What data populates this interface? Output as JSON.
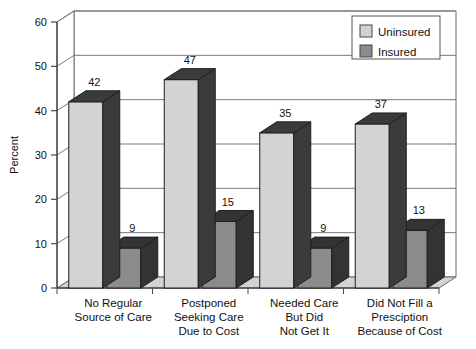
{
  "chart_data": {
    "type": "bar",
    "title": "",
    "subtitle": "",
    "xlabel": "",
    "ylabel": "Percent",
    "ylim": [
      0,
      60
    ],
    "ytick_step": 10,
    "yticks": [
      "0",
      "10",
      "20",
      "30",
      "40",
      "50",
      "60"
    ],
    "grid": true,
    "three_d": true,
    "legend_position": "top-right",
    "categories": [
      "No Regular\nSource of Care",
      "Postponed\nSeeking Care\nDue to Cost",
      "Needed Care\nBut Did\nNot Get It",
      "Did Not Fill a\nPresciption\nBecause of Cost"
    ],
    "series": [
      {
        "name": "Uninsured",
        "values": [
          42,
          47,
          35,
          37
        ],
        "color": "#d3d3d3",
        "side_color": "#3b3b3b",
        "top_color": "#3b3b3b"
      },
      {
        "name": "Insured",
        "values": [
          9,
          15,
          9,
          13
        ],
        "color": "#8b8b8b",
        "side_color": "#333333",
        "top_color": "#333333"
      }
    ],
    "value_labels": [
      [
        "42",
        "9"
      ],
      [
        "47",
        "15"
      ],
      [
        "35",
        "9"
      ],
      [
        "37",
        "13"
      ]
    ]
  },
  "legend": {
    "items": [
      {
        "label": "Uninsured",
        "swatch": "#d3d3d3"
      },
      {
        "label": "Insured",
        "swatch": "#8b8b8b"
      }
    ]
  },
  "axis": {
    "y_title": "Percent",
    "y_ticks": [
      "60",
      "50",
      "40",
      "30",
      "20",
      "10",
      "0"
    ]
  },
  "colors": {
    "plot_background": "#ffffff",
    "floor": "#d3d3d3",
    "wall_line": "#6b6b6b",
    "grid_line": "#7a7a7a",
    "axis_line": "#4a4a4a",
    "frame": "#2a2a2a"
  }
}
